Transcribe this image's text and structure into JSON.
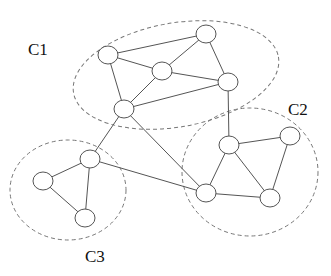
{
  "diagram": {
    "type": "graph-communities",
    "clusters": [
      {
        "id": "C1",
        "label": "C1",
        "cx": 176,
        "cy": 75,
        "rx": 104,
        "ry": 52,
        "rotate": -10,
        "label_x": 28,
        "label_y": 55
      },
      {
        "id": "C2",
        "label": "C2",
        "cx": 250,
        "cy": 172,
        "rx": 68,
        "ry": 64,
        "rotate": 0,
        "label_x": 288,
        "label_y": 115
      },
      {
        "id": "C3",
        "label": "C3",
        "cx": 68,
        "cy": 190,
        "rx": 58,
        "ry": 50,
        "rotate": 0,
        "label_x": 85,
        "label_y": 262
      }
    ],
    "nodes": [
      {
        "id": "n1",
        "cluster": "C1",
        "x": 108,
        "y": 55
      },
      {
        "id": "n2",
        "cluster": "C1",
        "x": 206,
        "y": 34
      },
      {
        "id": "n3",
        "cluster": "C1",
        "x": 162,
        "y": 71
      },
      {
        "id": "n4",
        "cluster": "C1",
        "x": 228,
        "y": 82
      },
      {
        "id": "n5",
        "cluster": "C1",
        "x": 124,
        "y": 109
      },
      {
        "id": "n6",
        "cluster": "C2",
        "x": 229,
        "y": 145
      },
      {
        "id": "n7",
        "cluster": "C2",
        "x": 290,
        "y": 136
      },
      {
        "id": "n8",
        "cluster": "C2",
        "x": 206,
        "y": 193
      },
      {
        "id": "n9",
        "cluster": "C2",
        "x": 270,
        "y": 198
      },
      {
        "id": "n10",
        "cluster": "C3",
        "x": 90,
        "y": 159
      },
      {
        "id": "n11",
        "cluster": "C3",
        "x": 43,
        "y": 181
      },
      {
        "id": "n12",
        "cluster": "C3",
        "x": 85,
        "y": 218
      }
    ],
    "edges": [
      [
        "n1",
        "n2"
      ],
      [
        "n1",
        "n3"
      ],
      [
        "n1",
        "n5"
      ],
      [
        "n2",
        "n3"
      ],
      [
        "n2",
        "n4"
      ],
      [
        "n3",
        "n4"
      ],
      [
        "n3",
        "n5"
      ],
      [
        "n5",
        "n4"
      ],
      [
        "n4",
        "n6"
      ],
      [
        "n5",
        "n10"
      ],
      [
        "n5",
        "n8"
      ],
      [
        "n10",
        "n8"
      ],
      [
        "n10",
        "n11"
      ],
      [
        "n10",
        "n12"
      ],
      [
        "n11",
        "n12"
      ],
      [
        "n6",
        "n7"
      ],
      [
        "n6",
        "n8"
      ],
      [
        "n6",
        "n9"
      ],
      [
        "n7",
        "n9"
      ],
      [
        "n8",
        "n9"
      ]
    ],
    "node_radius_x": 10,
    "node_radius_y": 9
  }
}
